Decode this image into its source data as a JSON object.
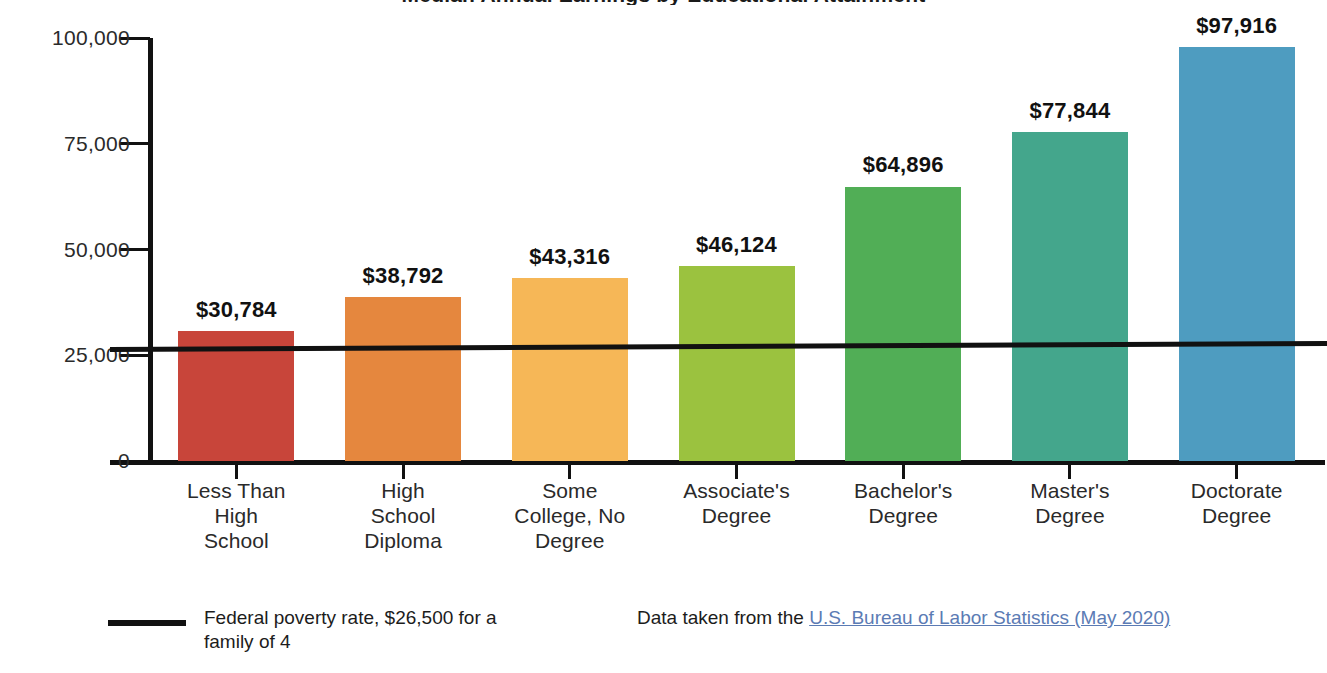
{
  "chart_data": {
    "type": "bar",
    "title": "Median Annual Earnings by Educational Attainment",
    "title_clipped": true,
    "xlabel": "",
    "ylabel": "",
    "ylim": [
      0,
      100000
    ],
    "grid": false,
    "legend_position": "bottom-left",
    "categories": [
      "Less Than\nHigh\nSchool",
      "High\nSchool\nDiploma",
      "Some\nCollege, No\nDegree",
      "Associate's\nDegree",
      "Bachelor's\nDegree",
      "Master's\nDegree",
      "Doctorate\nDegree"
    ],
    "values": [
      30784,
      38792,
      43316,
      46124,
      64896,
      77844,
      97916
    ],
    "value_labels": [
      "$30,784",
      "$38,792",
      "$43,316",
      "$46,124",
      "$64,896",
      "$77,844",
      "$97,916"
    ],
    "bar_colors": [
      "#c8453a",
      "#e5873e",
      "#f6b757",
      "#9bc23f",
      "#51ae56",
      "#44a68c",
      "#4e9cc0"
    ],
    "y_ticks": [
      0,
      25000,
      50000,
      75000,
      100000
    ],
    "y_tick_labels": [
      "0",
      "25,000",
      "50,000",
      "75,000",
      "100,000"
    ],
    "reference_line": {
      "value": 26500,
      "label": "Federal poverty rate, $26,500 for a family of 4",
      "color": "#111111"
    }
  },
  "axis": {
    "y_tick_labels": [
      "100,000",
      "75,000",
      "50,000",
      "25,000",
      "0"
    ]
  },
  "footer": {
    "legend_label": "Federal poverty rate, $26,500 for a family of 4",
    "source_prefix": "Data taken from the ",
    "source_link_text": "U.S. Bureau of Labor Statistics (May 2020)",
    "link_color": "#5b7bb4"
  }
}
